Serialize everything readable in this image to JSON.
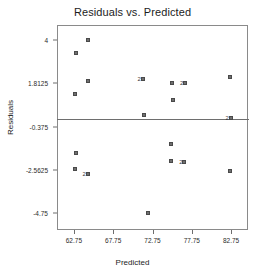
{
  "chart_data": {
    "type": "scatter",
    "title": "Residuals vs. Predicted",
    "xlabel": "Predicted",
    "ylabel": "Residuals",
    "xlim": [
      60.6,
      84.9
    ],
    "ylim": [
      -5.6,
      4.75
    ],
    "grid": false,
    "legend": null,
    "reference_line": {
      "orientation": "horizontal",
      "y": 0,
      "color": "#6e6e6e"
    },
    "xticks": [
      62.75,
      67.75,
      72.75,
      77.75,
      82.75
    ],
    "xtick_labels": [
      "62.75",
      "67.75",
      "72.75",
      "77.75",
      "82.75"
    ],
    "yticks": [
      4,
      1.8125,
      -0.375,
      -2.5625,
      -4.75
    ],
    "ytick_labels": [
      "4",
      "1.8125",
      "-0.375",
      "-2.5625",
      "-4.75"
    ],
    "marker_style": "open-square",
    "marker_color": "#6f6f6f",
    "points": [
      {
        "x": 63.0,
        "y": 3.35,
        "count": 1
      },
      {
        "x": 64.6,
        "y": 4.0,
        "count": 1
      },
      {
        "x": 64.6,
        "y": 1.92,
        "count": 1
      },
      {
        "x": 62.9,
        "y": 1.25,
        "count": 1
      },
      {
        "x": 71.5,
        "y": 2.02,
        "count": 2
      },
      {
        "x": 75.2,
        "y": 1.8,
        "count": 1
      },
      {
        "x": 76.9,
        "y": 1.83,
        "count": 2
      },
      {
        "x": 82.6,
        "y": 2.1,
        "count": 1
      },
      {
        "x": 75.3,
        "y": 0.98,
        "count": 1
      },
      {
        "x": 71.7,
        "y": 0.22,
        "count": 1
      },
      {
        "x": 82.7,
        "y": 0.05,
        "count": 2
      },
      {
        "x": 75.1,
        "y": -1.25,
        "count": 1
      },
      {
        "x": 63.0,
        "y": -1.72,
        "count": 1
      },
      {
        "x": 75.1,
        "y": -2.12,
        "count": 1
      },
      {
        "x": 76.8,
        "y": -2.15,
        "count": 2
      },
      {
        "x": 62.9,
        "y": -2.52,
        "count": 1
      },
      {
        "x": 64.5,
        "y": -2.75,
        "count": 2
      },
      {
        "x": 82.6,
        "y": -2.62,
        "count": 1
      },
      {
        "x": 72.2,
        "y": -4.75,
        "count": 1
      }
    ],
    "overlap_label": "2"
  }
}
